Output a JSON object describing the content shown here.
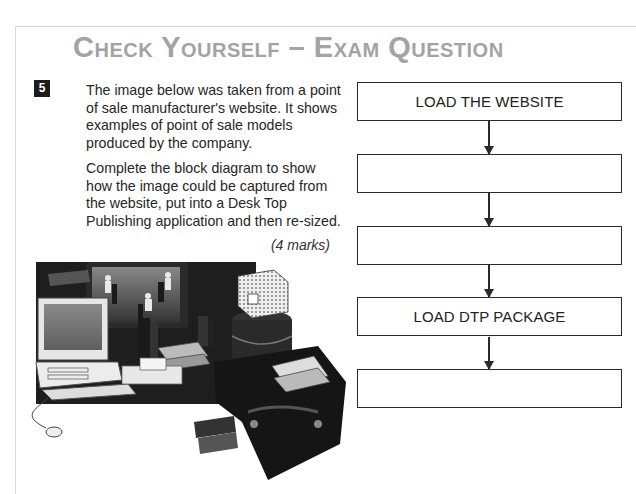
{
  "header": {
    "title": "Check Yourself – Exam Question"
  },
  "question": {
    "number": "5",
    "paragraphs": [
      "The image below was taken from a point of sale manufacturer's website. It shows examples of point of sale models produced by the company.",
      "Complete the block diagram to show how the image could be captured from the website, put into a Desk Top Publishing application and then re-sized."
    ],
    "marks": "(4 marks)"
  },
  "illustration": {
    "description": "Point of sale models: TV showing dancers, desktop computer with keyboard and mouse, books, boxes, trunk"
  },
  "block_diagram": {
    "boxes": [
      {
        "label": "LOAD THE WEBSITE"
      },
      {
        "label": ""
      },
      {
        "label": ""
      },
      {
        "label": "LOAD DTP PACKAGE"
      },
      {
        "label": ""
      }
    ]
  }
}
